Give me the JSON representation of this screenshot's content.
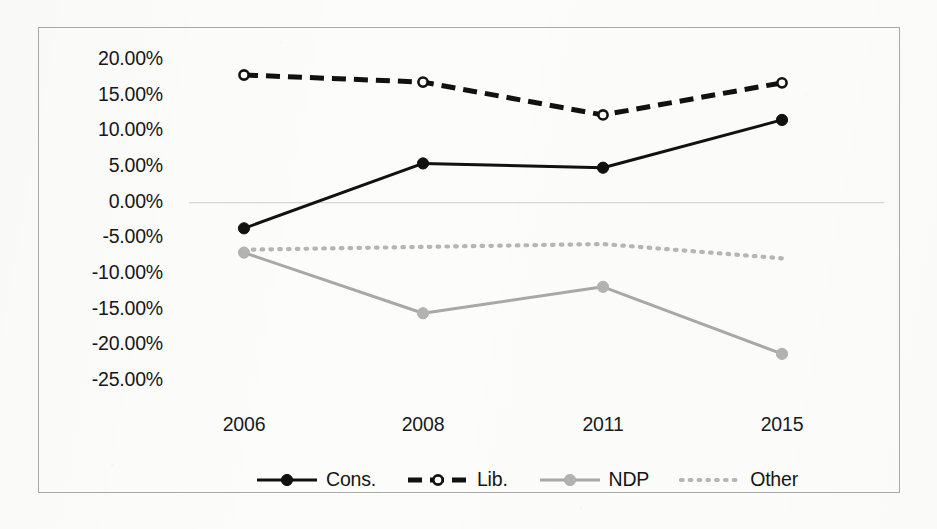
{
  "chart_data": {
    "type": "line",
    "title": "",
    "subtitle": "",
    "xlabel": "",
    "ylabel": "",
    "categories": [
      "2006",
      "2008",
      "2011",
      "2015"
    ],
    "x": [
      2006,
      2008,
      2011,
      2015
    ],
    "ylim": [
      -25.0,
      20.0
    ],
    "ytick_step": 5.0,
    "ytick_labels": [
      "20.00%",
      "15.00%",
      "10.00%",
      "5.00%",
      "0.00%",
      "-5.00%",
      "-10.00%",
      "-15.00%",
      "-20.00%",
      "-25.00%"
    ],
    "ytick_values": [
      20.0,
      15.0,
      10.0,
      5.0,
      0.0,
      -5.0,
      -10.0,
      -15.0,
      -20.0,
      -25.0
    ],
    "xtick_labels": [
      "2006",
      "2008",
      "2011",
      "2015"
    ],
    "grid": "zero-line-only",
    "legend_position": "bottom-center",
    "value_unit": "percent",
    "series": [
      {
        "name": "Cons.",
        "values": [
          -3.6,
          5.5,
          4.9,
          11.6
        ],
        "line_style": "solid",
        "color": "#111111",
        "marker": "filled-circle",
        "marker_color": "#111111"
      },
      {
        "name": "Lib.",
        "values": [
          17.9,
          16.9,
          12.3,
          16.8
        ],
        "line_style": "dashed",
        "color": "#111111",
        "marker": "open-circle",
        "marker_color": "#111111"
      },
      {
        "name": "NDP",
        "values": [
          -7.0,
          -15.5,
          -11.8,
          -21.2
        ],
        "line_style": "solid",
        "color": "#a8a8a8",
        "marker": "filled-circle",
        "marker_color": "#b2b2b2"
      },
      {
        "name": "Other",
        "values": [
          -6.6,
          -6.2,
          -5.8,
          -7.8
        ],
        "line_style": "dotted",
        "color": "#b5b5b5",
        "marker": "none",
        "marker_color": "#b5b5b5"
      }
    ]
  },
  "legend": {
    "items": [
      {
        "label": "Cons."
      },
      {
        "label": "Lib."
      },
      {
        "label": "NDP"
      },
      {
        "label": "Other"
      }
    ]
  },
  "colors": {
    "dark": "#111111",
    "grey": "#a8a8a8",
    "light_grey": "#b5b5b5",
    "zero_line": "#d8d8d6",
    "frame": "#a9a9a7",
    "background": "#fcfcfb"
  }
}
